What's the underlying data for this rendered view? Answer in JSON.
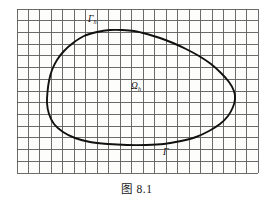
{
  "figure": {
    "caption": "图 8.1",
    "background_color": "#ffffff",
    "grid_color": "#5b5b5b",
    "curve_color": "#111111"
  },
  "labels": {
    "boundary_discrete": {
      "symbol": "Γ",
      "subscript": "h",
      "x": 88,
      "y": 22
    },
    "domain_discrete": {
      "symbol": "Ω",
      "subscript": "h",
      "x": 131,
      "y": 89
    },
    "boundary_true": {
      "symbol": "Γ",
      "subscript": "",
      "x": 163,
      "y": 155
    }
  },
  "chart_data": {
    "type": "diagram",
    "title": "图 8.1",
    "grid": {
      "x_start": 17,
      "y_start": 9,
      "cell_width": 11.48,
      "cell_height": 11.72,
      "columns": 21,
      "rows": 14,
      "x_end": 258,
      "y_end": 173,
      "show": true
    },
    "curve": {
      "closed": true,
      "points": [
        [
          47,
          103
        ],
        [
          47.5,
          92
        ],
        [
          49,
          81
        ],
        [
          52,
          70
        ],
        [
          57,
          60
        ],
        [
          64,
          51
        ],
        [
          73,
          43
        ],
        [
          84,
          36
        ],
        [
          97,
          32
        ],
        [
          110,
          30
        ],
        [
          122,
          30
        ],
        [
          134,
          31
        ],
        [
          147,
          34
        ],
        [
          160,
          38
        ],
        [
          173,
          43
        ],
        [
          186,
          49
        ],
        [
          199,
          56
        ],
        [
          211,
          64
        ],
        [
          221,
          73
        ],
        [
          229,
          82
        ],
        [
          234,
          91
        ],
        [
          235,
          99
        ],
        [
          233,
          107
        ],
        [
          228,
          116
        ],
        [
          220,
          124
        ],
        [
          209,
          131
        ],
        [
          196,
          137
        ],
        [
          181,
          141
        ],
        [
          164,
          144
        ],
        [
          146,
          145
        ],
        [
          127,
          145
        ],
        [
          108,
          144
        ],
        [
          90,
          142
        ],
        [
          75,
          138
        ],
        [
          63,
          132
        ],
        [
          54,
          124
        ],
        [
          49,
          114
        ],
        [
          47,
          103
        ]
      ]
    }
  }
}
